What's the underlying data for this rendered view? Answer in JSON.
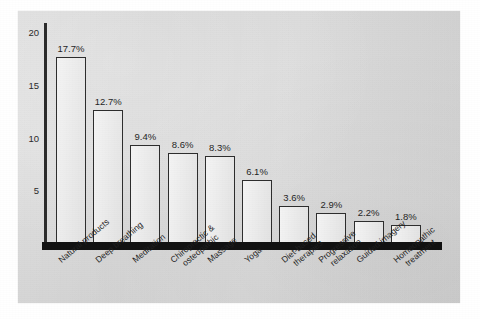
{
  "chart_data": {
    "type": "bar",
    "title": "",
    "subtitle": "",
    "xlabel": "",
    "ylabel": "",
    "ylim": [
      0,
      20
    ],
    "grid": false,
    "legend": null,
    "ytick_labels": [
      "20",
      "15",
      "10",
      "5"
    ],
    "ytick_values": [
      20,
      15,
      10,
      5
    ],
    "categories": [
      "Natural products",
      "Deep breathing",
      "Meditation",
      "Chiropractic & osteopathic",
      "Massage",
      "Yoga",
      "Diet-based therapies",
      "Progressive relaxation",
      "Guided imagery",
      "Homeopathic treatment"
    ],
    "values": [
      17.7,
      12.7,
      9.4,
      8.6,
      8.3,
      6.1,
      3.6,
      2.9,
      2.2,
      1.8
    ],
    "data_labels": [
      "17.7%",
      "12.7%",
      "9.4%",
      "8.6%",
      "8.3%",
      "6.1%",
      "3.6%",
      "2.9%",
      "2.2%",
      "1.8%"
    ],
    "bars": [
      {
        "label": "Natural products",
        "label_line1": "Natural products",
        "label_line2": "",
        "value": 17.7,
        "data_label": "17.7%"
      },
      {
        "label": "Deep breathing",
        "label_line1": "Deep breathing",
        "label_line2": "",
        "value": 12.7,
        "data_label": "12.7%"
      },
      {
        "label": "Meditation",
        "label_line1": "Meditation",
        "label_line2": "",
        "value": 9.4,
        "data_label": "9.4%"
      },
      {
        "label": "Chiropractic & osteopathic",
        "label_line1": "Chiropractic &",
        "label_line2": "osteopathic",
        "value": 8.6,
        "data_label": "8.6%"
      },
      {
        "label": "Massage",
        "label_line1": "Massage",
        "label_line2": "",
        "value": 8.3,
        "data_label": "8.3%"
      },
      {
        "label": "Yoga",
        "label_line1": "Yoga",
        "label_line2": "",
        "value": 6.1,
        "data_label": "6.1%"
      },
      {
        "label": "Diet-based therapies",
        "label_line1": "Diet-based",
        "label_line2": "therapies",
        "value": 3.6,
        "data_label": "3.6%"
      },
      {
        "label": "Progressive relaxation",
        "label_line1": "Progressive",
        "label_line2": "relaxation",
        "value": 2.9,
        "data_label": "2.9%"
      },
      {
        "label": "Guided imagery",
        "label_line1": "Guided imagery",
        "label_line2": "",
        "value": 2.2,
        "data_label": "2.2%"
      },
      {
        "label": "Homeopathic treatment",
        "label_line1": "Homeopathic",
        "label_line2": "treatment",
        "value": 1.8,
        "data_label": "1.8%"
      }
    ],
    "colors": {
      "panel_background": "#d9d9d9",
      "page_background": "#ffffff",
      "bar_fill": "#efefef",
      "bar_border": "#2d2d2d",
      "axis": "#2b2b2b",
      "baseline": "#111111",
      "text": "#1f1f1f"
    }
  }
}
